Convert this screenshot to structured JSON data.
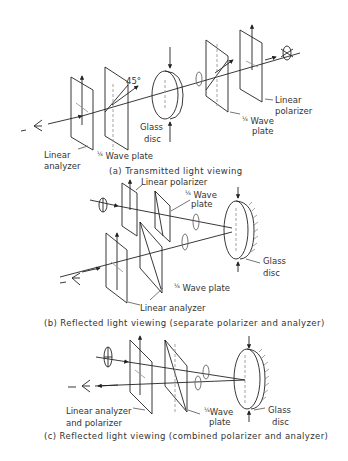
{
  "figure": {
    "panels": [
      {
        "id": "a",
        "caption": "(a) Transmitted light viewing",
        "labels": {
          "linear_analyzer": "Linear analyzer",
          "quarter_wave_plate_left": "¼ Wave plate",
          "angle": "45°",
          "glass_disc": "Glass disc",
          "quarter_wave_plate_right": "¼ Wave plate",
          "linear_polarizer": "Linear polarizer"
        }
      },
      {
        "id": "b",
        "caption": "(b) Reflected light viewing (separate polarizer and analyzer)",
        "labels": {
          "linear_polarizer": "Linear polarizer",
          "quarter_wave_plate_top": "¼ Wave plate",
          "quarter_wave_plate_bottom": "¼ Wave plate",
          "glass_disc": "Glass disc",
          "linear_analyzer": "Linear analyzer"
        }
      },
      {
        "id": "c",
        "caption": "(c) Reflected light viewing (combined polarizer and analyzer)",
        "labels": {
          "linear_analyzer_polarizer": "Linear analyzer and polarizer",
          "quarter_wave_plate": "¼ Wave plate",
          "glass_disc": "Glass disc"
        }
      }
    ]
  },
  "text": {
    "a_linear": "Linear",
    "a_analyzer": "analyzer",
    "a_qwp_left": "Wave plate",
    "a_45": "45°",
    "a_glass": "Glass",
    "a_disc": "disc",
    "a_qwp_right_1": "Wave",
    "a_qwp_right_2": "plate",
    "a_linpol_1": "Linear",
    "a_linpol_2": "polarizer",
    "a_caption": "(a) Transmitted light viewing",
    "b_linpol": "Linear polarizer",
    "b_qwp_top_1": "Wave",
    "b_qwp_top_2": "plate",
    "b_qwp_bottom": "Wave plate",
    "b_glass": "Glass",
    "b_disc": "disc",
    "b_linan": "Linear analyzer",
    "b_caption": "(b) Reflected light viewing  (separate polarizer and analyzer)",
    "c_lap_1": "Linear analyzer",
    "c_lap_2": "and polarizer",
    "c_qwp_1": "Wave",
    "c_qwp_2": "plate",
    "c_glass": "Glass",
    "c_disc": "disc",
    "c_caption": "(c) Reflected light viewing  (combined polarizer and analyzer)",
    "quarter": "¼"
  }
}
